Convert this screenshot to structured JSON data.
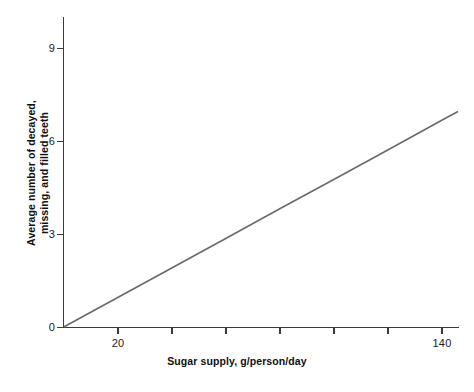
{
  "chart_data": {
    "type": "line",
    "title": "",
    "xlabel": "Sugar supply, g/person/day",
    "ylabel": "Average number of decayed,\nmissing, and filled teeth",
    "ylabel_line1": "Average number of decayed,",
    "ylabel_line2": "missing, and filled teeth",
    "grid": false,
    "legend": false,
    "xlim": [
      0,
      146
    ],
    "ylim": [
      0,
      9.6
    ],
    "x_tick_values": [
      20,
      40,
      60,
      80,
      100,
      120,
      140
    ],
    "x_tick_labels": [
      "20",
      "",
      "",
      "",
      "",
      "",
      "140"
    ],
    "x_visible_tick_labels": [
      "20",
      "140"
    ],
    "y_tick_values": [
      0,
      3,
      6,
      9
    ],
    "y_tick_labels": [
      "0",
      "3",
      "6",
      "9"
    ],
    "series": [
      {
        "name": "Average DMFT vs sugar supply",
        "color": "#6b6b6b",
        "x": [
          0,
          20,
          40,
          60,
          80,
          100,
          120,
          140,
          146
        ],
        "values": [
          0.0,
          0.91,
          1.83,
          2.74,
          3.66,
          4.57,
          5.48,
          6.4,
          6.67
        ]
      }
    ],
    "annotations": []
  },
  "figure": {
    "background_color": "#ffffff",
    "axis_color": "#3b3b3b",
    "text_color": "#1a1a1a",
    "line_color": "#6b6b6b"
  }
}
